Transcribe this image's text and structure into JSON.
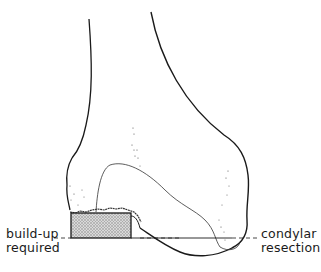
{
  "diagram": {
    "type": "anatomical-illustration",
    "labels": {
      "left": {
        "line1": "build-up",
        "line2": "required"
      },
      "right": {
        "line1": "condylar",
        "line2": "resection"
      }
    },
    "colors": {
      "outline": "#1a1a1a",
      "hatch_fill": "#bdbdbd",
      "background": "#ffffff"
    }
  }
}
